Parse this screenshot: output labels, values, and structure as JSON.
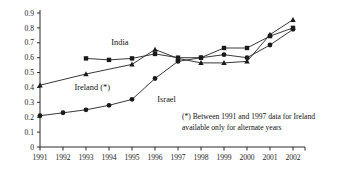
{
  "chart_data": {
    "type": "line",
    "title": "",
    "xlabel": "",
    "ylabel": "",
    "x": [
      1991,
      1992,
      1993,
      1994,
      1995,
      1996,
      1997,
      1998,
      1999,
      2000,
      2001,
      2002
    ],
    "xtick_labels": [
      "1991",
      "1992",
      "1993",
      "1994",
      "1995",
      "1996",
      "1997",
      "1998",
      "1999",
      "2000",
      "2001",
      "2002"
    ],
    "ytick_labels": [
      "0",
      "0.1",
      "0.2",
      "0.3",
      "0.4",
      "0.5",
      "0.6",
      "0.7",
      "0.8",
      "0.9"
    ],
    "ytick_values": [
      0,
      0.1,
      0.2,
      0.3,
      0.4,
      0.5,
      0.6,
      0.7,
      0.8,
      0.9
    ],
    "ylim": [
      0,
      0.9
    ],
    "xlim": [
      1991,
      2002
    ],
    "grid": false,
    "legend_position": "inline-annotations",
    "series": [
      {
        "name": "Israel",
        "marker": "circle",
        "label_x": 1996.1,
        "label_y": 0.3,
        "points": [
          {
            "x": 1991,
            "y": 0.21
          },
          {
            "x": 1992,
            "y": 0.23
          },
          {
            "x": 1993,
            "y": 0.25
          },
          {
            "x": 1994,
            "y": 0.28
          },
          {
            "x": 1995,
            "y": 0.32
          },
          {
            "x": 1996,
            "y": 0.46
          },
          {
            "x": 1997,
            "y": 0.575
          },
          {
            "x": 1998,
            "y": 0.6
          },
          {
            "x": 1999,
            "y": 0.62
          },
          {
            "x": 2000,
            "y": 0.6
          },
          {
            "x": 2001,
            "y": 0.685
          },
          {
            "x": 2002,
            "y": 0.79
          }
        ]
      },
      {
        "name": "India",
        "marker": "square",
        "label_x": 1994.1,
        "label_y": 0.685,
        "points": [
          {
            "x": 1993,
            "y": 0.595
          },
          {
            "x": 1994,
            "y": 0.585
          },
          {
            "x": 1995,
            "y": 0.595
          },
          {
            "x": 1996,
            "y": 0.625
          },
          {
            "x": 1997,
            "y": 0.6
          },
          {
            "x": 1998,
            "y": 0.6
          },
          {
            "x": 1999,
            "y": 0.665
          },
          {
            "x": 2000,
            "y": 0.665
          },
          {
            "x": 2001,
            "y": 0.745
          },
          {
            "x": 2002,
            "y": 0.8
          }
        ]
      },
      {
        "name": "Ireland (*)",
        "marker": "triangle",
        "label_x": 1992.5,
        "label_y": 0.385,
        "points": [
          {
            "x": 1991,
            "y": 0.415
          },
          {
            "x": 1993,
            "y": 0.49
          },
          {
            "x": 1995,
            "y": 0.555
          },
          {
            "x": 1996,
            "y": 0.655
          },
          {
            "x": 1997,
            "y": 0.595
          },
          {
            "x": 1998,
            "y": 0.565
          },
          {
            "x": 1999,
            "y": 0.565
          },
          {
            "x": 2000,
            "y": 0.575
          },
          {
            "x": 2001,
            "y": 0.755
          },
          {
            "x": 2002,
            "y": 0.855
          }
        ]
      }
    ],
    "annotations": [
      {
        "name": "footnote",
        "line1": "(*) Between 1991 and 1997 data for Ireland",
        "line2": "available only for alternate years"
      }
    ]
  }
}
